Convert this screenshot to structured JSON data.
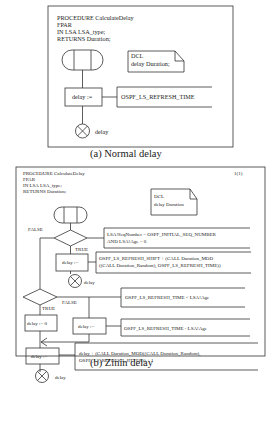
{
  "diagram_a": {
    "caption": "(a) Normal delay",
    "header": [
      "PROCEDURE CalculateDelay",
      "FPAR",
      "IN LSA LSA_type;",
      "RETURNS Duration;"
    ],
    "dcl": [
      "DCL",
      "delay Duration;"
    ],
    "task_label": "delay :=",
    "task_comment": "OSPF_LS_REFRESH_TIME",
    "return_label": "delay"
  },
  "diagram_b": {
    "caption": "(b) Zinin delay",
    "page": "1(1)",
    "header": [
      "PROCEDURE CalculateDelay",
      "FPAR",
      "IN LSA LSA_type;",
      "RETURNS Duration;"
    ],
    "dcl": [
      "DCL",
      "delay Duration"
    ],
    "decision1": {
      "false_label": "FALSE",
      "true_label": "TRUE",
      "comment": [
        "LSA!SeqNumber = OSPF_INITIAL_SEQ_NUMBER",
        "AND LSA!Age = 0"
      ]
    },
    "task1": {
      "label": "delay :=",
      "comment": [
        "OSPF_LS_REFRESH_SHIFT + (CALL Duration_MOD",
        "((CALL Duration_Random), OSPF_LS_REFRESH_TIME))"
      ]
    },
    "return1_label": "delay",
    "decision2": {
      "false_label": "FALSE",
      "true_label": "TRUE",
      "comment": "OSPF_LS_REFRESH_TIME < LSA!Age"
    },
    "task_true": {
      "label": "delay := 0"
    },
    "task_false": {
      "label": "delay :=",
      "comment": "OSPF_LS_REFRESH_TIME - LSA!Age"
    },
    "task_final": {
      "label": "delay :=",
      "comment": [
        "delay + (CALL Duration_MOD((CALL Duration_Random),",
        "OSPF_LS_REFRESH_JITTER)) + 1"
      ]
    },
    "return2_label": "delay"
  }
}
